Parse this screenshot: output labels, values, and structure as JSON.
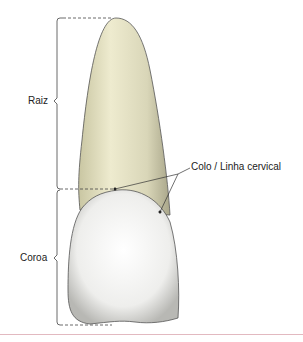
{
  "diagram": {
    "labels": {
      "root": "Raiz",
      "crown": "Coroa",
      "neck": "Colo / Linha cervical"
    },
    "colors": {
      "root_fill": "#e4e1c2",
      "crown_fill": "#f4f4f2",
      "outline": "#444444",
      "separator": "#e2b9c0"
    }
  }
}
